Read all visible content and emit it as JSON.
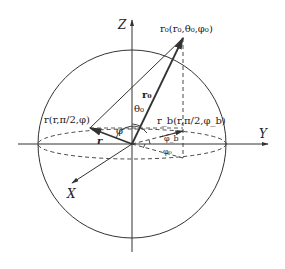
{
  "diagram": {
    "axes": {
      "z_label": "Z",
      "y_label": "Y",
      "x_label": "X"
    },
    "points": {
      "r0_label": "r₀(r₀,θ₀,φ₀)",
      "r_label": "r(r,π/2,φ)",
      "rb_label": "r_b(r,π/2,φ_b)"
    },
    "vectors": {
      "r0": "r₀",
      "r": "r"
    },
    "angles": {
      "theta0": "θ₀",
      "phi": "φ",
      "phi_b": "φ_b",
      "phi0": "φ₀"
    },
    "colors": {
      "ink": "#333333",
      "background": "#ffffff"
    }
  }
}
